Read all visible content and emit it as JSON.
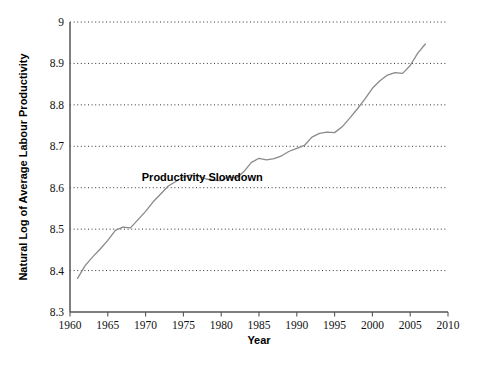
{
  "chart_data": {
    "type": "line",
    "title": "",
    "xlabel": "Year",
    "ylabel": "Natural Log of Average Labour Productivity",
    "xlim": [
      1960,
      2010
    ],
    "ylim": [
      8.3,
      9.0
    ],
    "xticks": [
      1960,
      1965,
      1970,
      1975,
      1980,
      1985,
      1990,
      1995,
      2000,
      2005,
      2010
    ],
    "yticks": [
      8.3,
      8.4,
      8.5,
      8.6,
      8.7,
      8.8,
      8.9,
      9
    ],
    "ytick_labels": [
      "8.3",
      "8.4",
      "8.5",
      "8.6",
      "8.7",
      "8.8",
      "8.9",
      "9"
    ],
    "xtick_labels": [
      "1960",
      "1965",
      "1970",
      "1975",
      "1980",
      "1985",
      "1990",
      "1995",
      "2000",
      "2005",
      "2010"
    ],
    "grid": "horizontal-dotted",
    "legend": "none",
    "line_color": "#8a8a8a",
    "line_width": 1.3,
    "annotations": [
      {
        "text": "Productivity Slowdown",
        "x": 1977.5,
        "y": 8.617
      }
    ],
    "series": [
      {
        "name": "Natural Log of Average Labour Productivity",
        "x": [
          1961,
          1962,
          1963,
          1964,
          1965,
          1966,
          1967,
          1968,
          1969,
          1970,
          1971,
          1972,
          1973,
          1974,
          1975,
          1976,
          1977,
          1978,
          1979,
          1980,
          1981,
          1982,
          1983,
          1984,
          1985,
          1986,
          1987,
          1988,
          1989,
          1990,
          1991,
          1992,
          1993,
          1994,
          1995,
          1996,
          1997,
          1998,
          1999,
          2000,
          2001,
          2002,
          2003,
          2004,
          2005,
          2006,
          2007
        ],
        "values": [
          8.381,
          8.412,
          8.433,
          8.452,
          8.473,
          8.497,
          8.505,
          8.503,
          8.523,
          8.543,
          8.566,
          8.585,
          8.604,
          8.615,
          8.626,
          8.631,
          8.628,
          8.621,
          8.618,
          8.617,
          8.627,
          8.623,
          8.639,
          8.661,
          8.671,
          8.667,
          8.67,
          8.677,
          8.688,
          8.695,
          8.702,
          8.722,
          8.731,
          8.734,
          8.733,
          8.747,
          8.768,
          8.79,
          8.814,
          8.84,
          8.858,
          8.872,
          8.878,
          8.876,
          8.895,
          8.925,
          8.947
        ]
      }
    ]
  },
  "geometry": {
    "plot_left": 70,
    "plot_right": 448,
    "plot_top": 22,
    "plot_bottom": 312
  }
}
